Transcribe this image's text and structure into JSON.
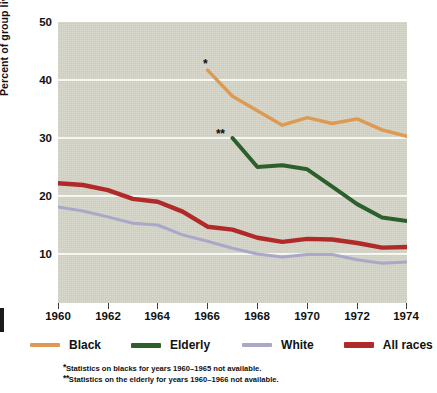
{
  "chart_data": {
    "type": "line",
    "title": "",
    "subtitle": "",
    "xlabel": "",
    "ylabel": "Percent of group living below poverty line",
    "xlim": [
      1960,
      1974
    ],
    "ylim": [
      5,
      50
    ],
    "grid": "horizontal",
    "legend_position": "bottom",
    "yticks": [
      50,
      40,
      30,
      20,
      10
    ],
    "xticks": [
      1960,
      1962,
      1964,
      1966,
      1968,
      1970,
      1972,
      1974
    ],
    "xtick_labels": [
      "1960",
      "1962",
      "1964",
      "1966",
      "1968",
      "1970",
      "1972",
      "1974"
    ],
    "series": [
      {
        "name": "Black",
        "color": "#dd9a52",
        "x": [
          1966,
          1967,
          1968,
          1969,
          1970,
          1971,
          1972,
          1973,
          1974
        ],
        "values": [
          41.7,
          37.2,
          34.7,
          32.2,
          33.5,
          32.5,
          33.3,
          31.4,
          30.3
        ]
      },
      {
        "name": "Elderly",
        "color": "#2c5f2c",
        "x": [
          1967,
          1968,
          1969,
          1970,
          1971,
          1972,
          1973,
          1974
        ],
        "values": [
          30.0,
          25.0,
          25.3,
          24.6,
          21.6,
          18.6,
          16.3,
          15.7
        ]
      },
      {
        "name": "White",
        "color": "#a9a8c9",
        "x": [
          1960,
          1961,
          1962,
          1963,
          1964,
          1965,
          1966,
          1967,
          1968,
          1969,
          1970,
          1971,
          1972,
          1973,
          1974
        ],
        "values": [
          18.1,
          17.4,
          16.4,
          15.3,
          15.0,
          13.3,
          12.2,
          11.0,
          10.0,
          9.5,
          9.9,
          9.9,
          9.0,
          8.4,
          8.6
        ]
      },
      {
        "name": "All races",
        "color": "#b02a2a",
        "x": [
          1960,
          1961,
          1962,
          1963,
          1964,
          1965,
          1966,
          1967,
          1968,
          1969,
          1970,
          1971,
          1972,
          1973,
          1974
        ],
        "values": [
          22.2,
          21.9,
          21.0,
          19.5,
          19.0,
          17.3,
          14.7,
          14.2,
          12.8,
          12.1,
          12.6,
          12.5,
          11.9,
          11.1,
          11.2
        ]
      }
    ],
    "annotations": [
      {
        "text": "*",
        "x": 1966,
        "y": 42.9
      },
      {
        "text": "**",
        "x": 1967,
        "y": 30.6
      }
    ]
  },
  "axis": {
    "y_title": "Percent of group living below poverty line",
    "y_ticks": [
      "50",
      "40",
      "30",
      "20",
      "10"
    ],
    "x_ticks": [
      "1960",
      "1962",
      "1964",
      "1966",
      "1968",
      "1970",
      "1972",
      "1974"
    ]
  },
  "legend": {
    "items": [
      {
        "label": "Black",
        "color": "#dd9a52"
      },
      {
        "label": "Elderly",
        "color": "#2c5f2c"
      },
      {
        "label": "White",
        "color": "#a9a8c9"
      },
      {
        "label": "All races",
        "color": "#b02a2a"
      }
    ]
  },
  "footnotes": {
    "one_marker": "*",
    "one_text": "Statistics on blacks for years 1960–1965 not available.",
    "two_marker": "**",
    "two_text": "Statistics on the elderly for years 1960–1966 not available."
  },
  "markers": {
    "black_series_note": "*",
    "elderly_series_note": "**"
  },
  "colors": {
    "plot_background": "#d5d4c7",
    "gridline": "#f7f7f2",
    "text": "#111111"
  }
}
